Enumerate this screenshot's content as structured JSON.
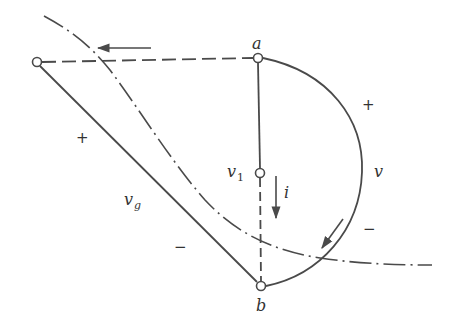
{
  "diagram": {
    "colors": {
      "stroke": "#4a4a4a",
      "background": "#ffffff"
    },
    "nodes": [
      {
        "id": "source-node",
        "x": 37,
        "y": 62
      },
      {
        "id": "a",
        "label": "a",
        "x": 258,
        "y": 58
      },
      {
        "id": "v1",
        "label": "v",
        "subscript": "1",
        "x": 260,
        "y": 173
      },
      {
        "id": "b",
        "label": "b",
        "x": 261,
        "y": 286
      }
    ],
    "labels": {
      "a": "a",
      "b": "b",
      "v1_main": "v",
      "v1_sub": "1",
      "v": "v",
      "vg_main": "v",
      "vg_sub": "g",
      "i": "i"
    },
    "signs": {
      "vg_plus": "+",
      "vg_minus": "−",
      "v_plus": "+",
      "v_minus": "−"
    },
    "arrows": [
      {
        "id": "top-arrow",
        "direction": "left"
      },
      {
        "id": "current-arrow-i",
        "direction": "down"
      },
      {
        "id": "arc-arrow",
        "direction": "down-left"
      }
    ],
    "edges": [
      {
        "from": "source-node",
        "to": "a",
        "style": "dashed"
      },
      {
        "from": "source-node",
        "to": "b",
        "style": "solid",
        "label": "vg"
      },
      {
        "from": "a",
        "to": "v1",
        "style": "solid"
      },
      {
        "from": "v1",
        "to": "b",
        "style": "dashed"
      },
      {
        "from": "a",
        "to": "b",
        "style": "solid-arc",
        "label": "v"
      }
    ],
    "curve": {
      "style": "dash-dot"
    }
  }
}
